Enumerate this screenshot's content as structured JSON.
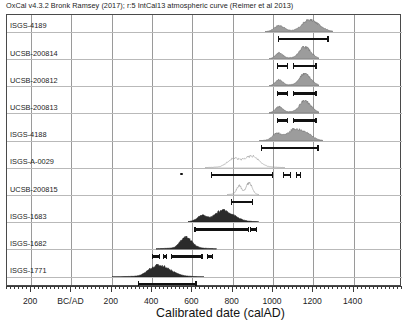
{
  "header": {
    "caption": "OxCal v4.3.2 Bronk Ramsey (2017); r:5 IntCal13 atmospheric curve (Reimer et al 2013)"
  },
  "axis": {
    "title": "Calibrated date (calAD)",
    "tick_labels": [
      "200",
      "BC/AD",
      "200",
      "400",
      "600",
      "800",
      "1000",
      "1200",
      "1400"
    ],
    "tick_values": [
      -200,
      0,
      200,
      400,
      600,
      800,
      1000,
      1200,
      1400
    ],
    "x_min": -320,
    "x_max": 1640,
    "minor_tick_step": 20
  },
  "chart_data": {
    "type": "area",
    "xlabel": "Calibrated date (calAD)",
    "ylabel": "",
    "xlim": [
      -320,
      1640
    ],
    "grid": true,
    "legend": "none",
    "series": [
      {
        "name": "ISGS-4189",
        "fill": "dark-gray",
        "curve_start": 960,
        "curve_end": 1300,
        "peaks": [
          1030,
          1170,
          1215
        ],
        "ranges": [
          {
            "from": 1025,
            "to": 1275
          }
        ]
      },
      {
        "name": "UCSB-200814",
        "fill": "dark-gray",
        "curve_start": 980,
        "curve_end": 1230,
        "peaks": [
          1030,
          1150,
          1175
        ],
        "ranges": [
          {
            "from": 1020,
            "to": 1075
          },
          {
            "from": 1100,
            "to": 1215
          }
        ]
      },
      {
        "name": "UCSB-200812",
        "fill": "dark-gray",
        "curve_start": 980,
        "curve_end": 1230,
        "peaks": [
          1030,
          1150,
          1175
        ],
        "ranges": [
          {
            "from": 1020,
            "to": 1075
          },
          {
            "from": 1100,
            "to": 1215
          }
        ]
      },
      {
        "name": "UCSB-200813",
        "fill": "dark-gray",
        "curve_start": 980,
        "curve_end": 1230,
        "peaks": [
          1030,
          1150,
          1175
        ],
        "ranges": [
          {
            "from": 1020,
            "to": 1075
          },
          {
            "from": 1100,
            "to": 1215
          }
        ]
      },
      {
        "name": "ISGS-4188",
        "fill": "dark-gray",
        "curve_start": 930,
        "curve_end": 1250,
        "peaks": [
          1020,
          1100,
          1160
        ],
        "ranges": [
          {
            "from": 940,
            "to": 1225
          }
        ]
      },
      {
        "name": "ISGS-A-0029",
        "fill": "outline",
        "curve_start": 660,
        "curve_end": 1060,
        "peaks": [
          800,
          890
        ],
        "ranges": [
          {
            "from": 540,
            "to": 545
          },
          {
            "from": 690,
            "to": 1000
          },
          {
            "from": 1050,
            "to": 1090
          },
          {
            "from": 1115,
            "to": 1140
          }
        ]
      },
      {
        "name": "UCSB-200815",
        "fill": "outline",
        "curve_start": 770,
        "curve_end": 930,
        "peaks": [
          830,
          880
        ],
        "ranges": [
          {
            "from": 790,
            "to": 900
          }
        ]
      },
      {
        "name": "ISGS-1683",
        "fill": "dark",
        "curve_start": 580,
        "curve_end": 930,
        "peaks": [
          650,
          740,
          790
        ],
        "ranges": [
          {
            "from": 610,
            "to": 880
          },
          {
            "from": 885,
            "to": 920
          }
        ]
      },
      {
        "name": "ISGS-1682",
        "fill": "dark",
        "curve_start": 420,
        "curve_end": 720,
        "peaks": [
          555,
          580
        ],
        "ranges": [
          {
            "from": 400,
            "to": 440
          },
          {
            "from": 455,
            "to": 475
          },
          {
            "from": 495,
            "to": 650
          },
          {
            "from": 670,
            "to": 700
          }
        ]
      },
      {
        "name": "ISGS-1771",
        "fill": "dark",
        "curve_start": 200,
        "curve_end": 660,
        "peaks": [
          400,
          440,
          470
        ],
        "ranges": [
          {
            "from": 330,
            "to": 620
          }
        ]
      }
    ]
  }
}
